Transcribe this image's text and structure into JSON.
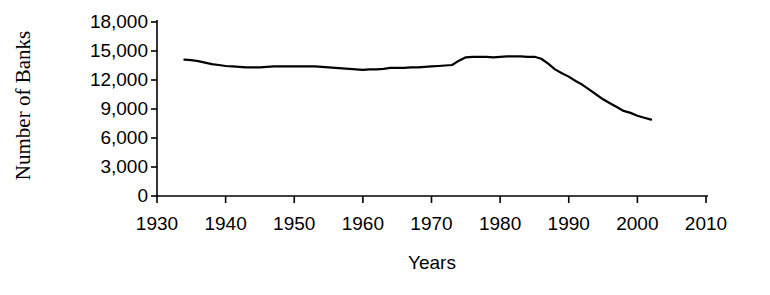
{
  "chart_data": {
    "type": "line",
    "title": "",
    "xlabel": "Years",
    "ylabel": "Number of Banks",
    "xlim": [
      1930,
      2010
    ],
    "ylim": [
      0,
      18000
    ],
    "grid": false,
    "legend": false,
    "xticks": [
      1930,
      1940,
      1950,
      1960,
      1970,
      1980,
      1990,
      2000,
      2010
    ],
    "xtick_labels": [
      "1930",
      "1940",
      "1950",
      "1960",
      "1970",
      "1980",
      "1990",
      "2000",
      "2010"
    ],
    "yticks": [
      0,
      3000,
      6000,
      9000,
      12000,
      15000,
      18000
    ],
    "ytick_labels": [
      "0",
      "3,000",
      "6,000",
      "9,000",
      "12,000",
      "15,000",
      "18,000"
    ],
    "series": [
      {
        "name": "Number of Banks",
        "color": "#000000",
        "line_width": 2.2,
        "marker": "none",
        "x": [
          1934,
          1935,
          1936,
          1937,
          1938,
          1939,
          1940,
          1941,
          1942,
          1943,
          1944,
          1945,
          1946,
          1947,
          1948,
          1949,
          1950,
          1951,
          1952,
          1953,
          1954,
          1955,
          1956,
          1957,
          1958,
          1959,
          1960,
          1961,
          1962,
          1963,
          1964,
          1965,
          1966,
          1967,
          1968,
          1969,
          1970,
          1971,
          1972,
          1973,
          1974,
          1975,
          1976,
          1977,
          1978,
          1979,
          1980,
          1981,
          1982,
          1983,
          1984,
          1985,
          1986,
          1987,
          1988,
          1989,
          1990,
          1991,
          1992,
          1993,
          1994,
          1995,
          1996,
          1997,
          1998,
          1999,
          2000,
          2001,
          2002
        ],
        "y": [
          14100,
          14050,
          13950,
          13800,
          13650,
          13550,
          13450,
          13400,
          13350,
          13300,
          13300,
          13300,
          13350,
          13400,
          13400,
          13400,
          13400,
          13400,
          13400,
          13400,
          13350,
          13300,
          13250,
          13200,
          13150,
          13100,
          13050,
          13100,
          13100,
          13150,
          13250,
          13250,
          13250,
          13300,
          13300,
          13350,
          13400,
          13450,
          13500,
          13550,
          14000,
          14350,
          14400,
          14400,
          14400,
          14350,
          14400,
          14450,
          14450,
          14450,
          14400,
          14400,
          14200,
          13700,
          13100,
          12700,
          12350,
          11900,
          11500,
          11000,
          10500,
          10000,
          9600,
          9200,
          8800,
          8600,
          8300,
          8100,
          7900
        ]
      }
    ]
  },
  "axis": {
    "spine_color": "#000000",
    "tick_color": "#000000"
  }
}
